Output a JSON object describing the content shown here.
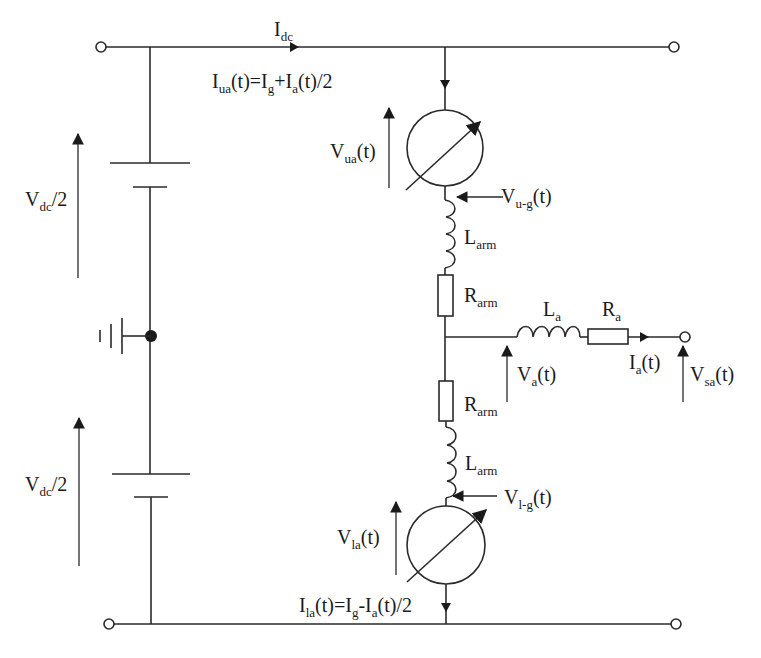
{
  "diagram": {
    "type": "circuit-schematic",
    "colors": {
      "line": "#2a2a2a",
      "text": "#1a1a1a",
      "background": "#ffffff"
    },
    "labels": {
      "idc": {
        "main": "I",
        "sub": "dc"
      },
      "iua": {
        "t1": "I",
        "s1": "ua",
        "t2": "(t)=I",
        "s2": "g",
        "t3": "+I",
        "s3": "a",
        "t4": "(t)/2"
      },
      "vua": {
        "main": "V",
        "sub": "ua",
        "rest": "(t)"
      },
      "vug": {
        "main": "V",
        "sub": "u-g",
        "rest": "(t)"
      },
      "larm_upper": {
        "main": "L",
        "sub": "arm"
      },
      "rarm_upper": {
        "main": "R",
        "sub": "arm"
      },
      "la": {
        "main": "L",
        "sub": "a"
      },
      "ra": {
        "main": "R",
        "sub": "a"
      },
      "va": {
        "main": "V",
        "sub": "a",
        "rest": "(t)"
      },
      "ia": {
        "main": "I",
        "sub": "a",
        "rest": "(t)"
      },
      "vsa": {
        "main": "V",
        "sub": "sa",
        "rest": "(t)"
      },
      "rarm_lower": {
        "main": "R",
        "sub": "arm"
      },
      "larm_lower": {
        "main": "L",
        "sub": "arm"
      },
      "vlg": {
        "main": "V",
        "sub": "l-g",
        "rest": "(t)"
      },
      "vla": {
        "main": "V",
        "sub": "la",
        "rest": "(t)"
      },
      "ila": {
        "t1": "I",
        "s1": "la",
        "t2": "(t)=I",
        "s2": "g",
        "t3": "-I",
        "s3": "a",
        "t4": "(t)/2"
      },
      "vdc_upper": {
        "main": "V",
        "sub": "dc",
        "rest": "/2"
      },
      "vdc_lower": {
        "main": "V",
        "sub": "dc",
        "rest": "/2"
      }
    },
    "components": [
      "dc-terminal-positive-left",
      "dc-terminal-positive-right",
      "dc-terminal-negative-left",
      "dc-terminal-negative-right",
      "upper-dc-source",
      "lower-dc-source",
      "ground-midpoint",
      "upper-arm-variable-voltage-source",
      "upper-arm-inductor",
      "upper-arm-resistor",
      "lower-arm-resistor",
      "lower-arm-inductor",
      "lower-arm-variable-voltage-source",
      "ac-inductor",
      "ac-resistor",
      "ac-terminal"
    ]
  }
}
